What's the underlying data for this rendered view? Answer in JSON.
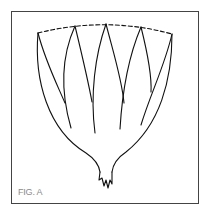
{
  "figure": {
    "caption": "FIG. A",
    "stroke_color": "#111111",
    "frame_color": "#444444",
    "caption_color": "#8a8a8a"
  }
}
